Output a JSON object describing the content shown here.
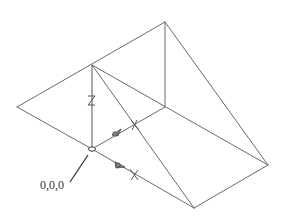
{
  "diagram": {
    "type": "wireframe-3d-wedge",
    "origin_label": "0,0,0",
    "axes": {
      "z_label": "Z",
      "x_label": "X",
      "y_label": "Y"
    },
    "colors": {
      "edge": "#6a6a6a",
      "axis": "#555555",
      "label": "#333333",
      "background": "#ffffff"
    },
    "vertices": {
      "top_apex": [
        165,
        22
      ],
      "left_top": [
        92,
        65
      ],
      "left_point": [
        17,
        107
      ],
      "inner": [
        165,
        107
      ],
      "origin": [
        92,
        149
      ],
      "right_point": [
        268,
        165
      ],
      "bottom": [
        194,
        208
      ]
    }
  }
}
